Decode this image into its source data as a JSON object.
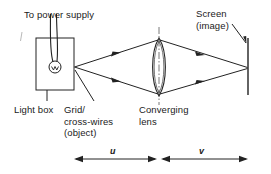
{
  "diagram": {
    "labels": {
      "power_supply": "To power supply",
      "screen": "Screen\n(image)",
      "light_box": "Light box",
      "grid_object": "Grid/\ncross-wires\n(object)",
      "converging_lens": "Converging\nlens",
      "distance_u": "u",
      "distance_v": "v"
    },
    "components": {
      "light_box": {
        "name": "light-box",
        "shape": "rectangle",
        "x": 36,
        "y": 38,
        "width": 38,
        "height": 52
      },
      "lamp": {
        "name": "lamp-bulb",
        "shape": "circle",
        "cx": 55,
        "cy": 67,
        "r": 6
      },
      "power_wires": {
        "name": "power-supply-wires",
        "count": 2
      },
      "object_point": {
        "name": "grid-cross-wires-object",
        "x": 74,
        "y": 67
      },
      "lens": {
        "name": "converging-lens",
        "shape": "biconvex",
        "cx": 159,
        "top_y": 38,
        "bottom_y": 96,
        "half_width": 7
      },
      "optical_axis": {
        "name": "lens-optical-axis",
        "style": "dash-dot",
        "x": 159,
        "y1": 28,
        "y2": 104
      },
      "screen": {
        "name": "screen",
        "shape": "vertical-line",
        "x": 248,
        "y1": 38,
        "y2": 95
      },
      "image_point": {
        "name": "image-point",
        "x": 248,
        "y": 68
      }
    },
    "rays": {
      "name": "light-rays",
      "description": "Two rays diverge from the object, refract at the lens, converge to the image on the screen",
      "count": 4,
      "arrowheads": 4
    },
    "dimensions": [
      {
        "name": "object-distance-u",
        "label": "u",
        "x_start": 74,
        "x_end": 157,
        "y": 159
      },
      {
        "name": "image-distance-v",
        "label": "v",
        "x_start": 161,
        "x_end": 248,
        "y": 159
      }
    ],
    "colors": {
      "background": "#ffffff",
      "ink": "#1a1a1a",
      "line": "#222222"
    }
  }
}
